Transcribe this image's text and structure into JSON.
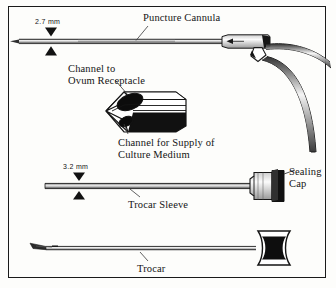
{
  "figure": {
    "kind": "technical-line-illustration",
    "background_color": "#fdfdfb",
    "ink_color": "#141414",
    "border_color": "#1a1a1a"
  },
  "labels": {
    "puncture_cannula": "Puncture Cannula",
    "channel_to_ovum_receptacle": "Channel to\nOvum Receptacle",
    "channel_for_supply_of_culture_medium": "Channel for Supply of\nCulture Medium",
    "trocar_sleeve": "Trocar Sleeve",
    "sealing_cap": "Sealing\nCap",
    "trocar": "Trocar"
  },
  "dimensions": {
    "cannula_diameter": "2.7 mm",
    "sleeve_diameter": "3.2 mm"
  },
  "parts": [
    {
      "id": "puncture-cannula",
      "name": "Puncture Cannula",
      "diameter": "2.7 mm"
    },
    {
      "id": "cannula-tip-detail",
      "name": "Cannula tip cutaway"
    },
    {
      "id": "trocar-sleeve",
      "name": "Trocar Sleeve",
      "diameter": "3.2 mm"
    },
    {
      "id": "sealing-cap",
      "name": "Sealing Cap"
    },
    {
      "id": "trocar",
      "name": "Trocar"
    }
  ]
}
